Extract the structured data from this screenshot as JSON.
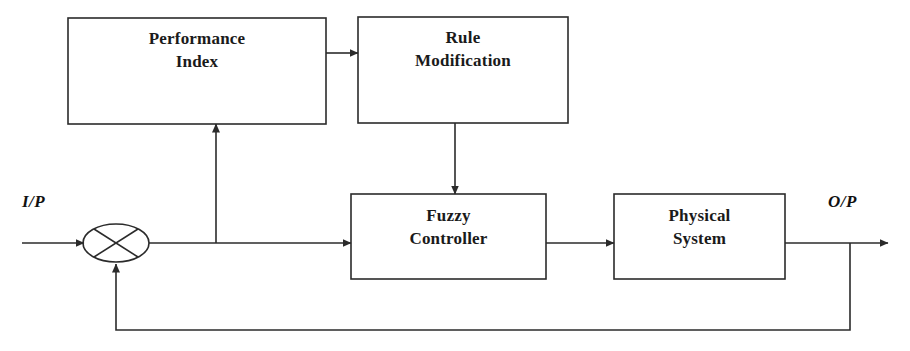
{
  "diagram": {
    "stroke_color": "#2b2b2b",
    "text_color": "#1a1a1a",
    "background_color": "#ffffff",
    "blocks": [
      {
        "id": "performance_index",
        "label": "Performance\nIndex",
        "x": 68,
        "y": 18,
        "w": 258,
        "h": 106
      },
      {
        "id": "rule_modification",
        "label": "Rule\nModification",
        "x": 358,
        "y": 17,
        "w": 210,
        "h": 106
      },
      {
        "id": "fuzzy_controller",
        "label": "Fuzzy\nController",
        "x": 351,
        "y": 194,
        "w": 195,
        "h": 85
      },
      {
        "id": "physical_system",
        "label": "Physical\nSystem",
        "x": 614,
        "y": 194,
        "w": 171,
        "h": 85
      }
    ],
    "summing_junction": {
      "id": "summing-junction",
      "label": "",
      "cx": 116,
      "cy": 243,
      "rx": 33,
      "ry": 19
    },
    "io_labels": [
      {
        "id": "input",
        "text": "I/P",
        "x": 22,
        "y": 192
      },
      {
        "id": "output",
        "text": "O/P",
        "x": 828,
        "y": 192
      }
    ],
    "connections": [
      {
        "id": "input-to-sum",
        "from": "I/P",
        "to": "summing-junction"
      },
      {
        "id": "sum-to-fuzzy-controller",
        "from": "summing-junction",
        "to": "fuzzy_controller"
      },
      {
        "id": "forward-tap-to-performance-index",
        "from": "forward-path",
        "to": "performance_index"
      },
      {
        "id": "performance-index-to-rule-modification",
        "from": "performance_index",
        "to": "rule_modification"
      },
      {
        "id": "rule-modification-to-fuzzy-controller",
        "from": "rule_modification",
        "to": "fuzzy_controller"
      },
      {
        "id": "fuzzy-controller-to-physical-system",
        "from": "fuzzy_controller",
        "to": "physical_system"
      },
      {
        "id": "physical-system-to-output",
        "from": "physical_system",
        "to": "O/P"
      },
      {
        "id": "feedback-to-summing-junction",
        "from": "output-tap",
        "to": "summing-junction"
      }
    ]
  }
}
